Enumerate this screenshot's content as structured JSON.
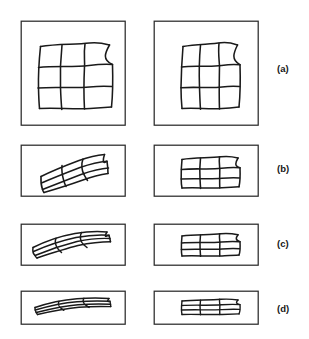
{
  "figure": {
    "background_color": "#ffffff",
    "stroke_color": "#1a1a1a",
    "frame_stroke_color": "#2b2b2b",
    "rows": [
      {
        "label": "(a)",
        "label_x": 277,
        "label_y": 64,
        "frame": {
          "x": 21,
          "y": 21,
          "w": 104,
          "h": 104
        },
        "frame_right": {
          "x": 154,
          "y": 21,
          "w": 104,
          "h": 104
        },
        "left_caption": "square frame with hand-drawn 3x3 deformed grid",
        "right_caption": "square frame with hand-drawn 3x3 deformed grid, narrower"
      },
      {
        "label": "(b)",
        "label_x": 277,
        "label_y": 164,
        "frame": {
          "x": 21,
          "y": 145,
          "w": 104,
          "h": 51
        },
        "frame_right": {
          "x": 154,
          "y": 145,
          "w": 104,
          "h": 51
        },
        "left_caption": "wide frame with sheared deformed grid",
        "right_caption": "wide frame with vertically compressed grid"
      },
      {
        "label": "(c)",
        "label_x": 277,
        "label_y": 239,
        "frame": {
          "x": 21,
          "y": 224,
          "w": 104,
          "h": 41
        },
        "frame_right": {
          "x": 154,
          "y": 224,
          "w": 104,
          "h": 41
        },
        "left_caption": "wide frame with strongly sheared lens-shaped grid",
        "right_caption": "wide frame with flattened grid"
      },
      {
        "label": "(d)",
        "label_x": 277,
        "label_y": 304,
        "frame": {
          "x": 21,
          "y": 291,
          "w": 104,
          "h": 33
        },
        "frame_right": {
          "x": 154,
          "y": 291,
          "w": 104,
          "h": 33
        },
        "left_caption": "wide frame with extremely flattened rhombic grid",
        "right_caption": "wide frame with extremely flattened grid"
      }
    ]
  },
  "labels": {
    "a": "(a)",
    "b": "(b)",
    "c": "(c)",
    "d": "(d)"
  }
}
